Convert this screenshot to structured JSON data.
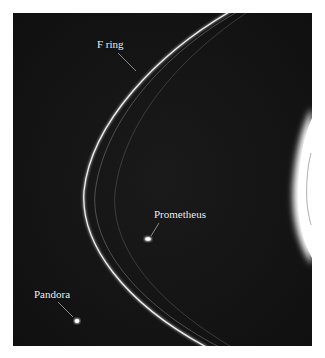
{
  "figure": {
    "labels": {
      "f_ring": "F ring",
      "prometheus": "Prometheus",
      "pandora": "Pandora"
    },
    "colors": {
      "background": "#ffffff",
      "space": "#141414",
      "ring": "#e8e8e8",
      "planet_glare": "#ffffff",
      "label_text": "#f2f2f2"
    }
  }
}
